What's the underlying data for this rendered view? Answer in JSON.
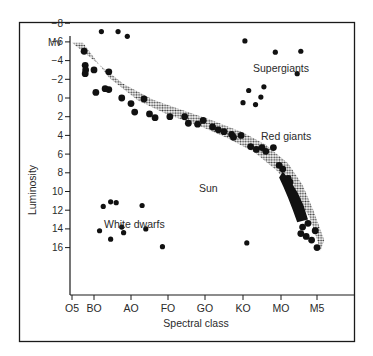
{
  "chart_data": {
    "type": "scatter",
    "title": "",
    "xlabel": "Spectral class",
    "ylabel": "Luminosity",
    "y_unit_label": "Mv",
    "x_categories": [
      "O5",
      "BO",
      "AO",
      "FO",
      "GO",
      "KO",
      "MO",
      "M5"
    ],
    "y_ticks": [
      -8,
      -6,
      -4,
      -2,
      0,
      2,
      4,
      6,
      8,
      10,
      12,
      14,
      16
    ],
    "y_tick_labels": [
      "−8",
      "−6",
      "−4",
      "−2",
      "0",
      "2",
      "4",
      "6",
      "8",
      "10",
      "12",
      "14",
      "16"
    ],
    "ylim": [
      17,
      -9
    ],
    "grid": false,
    "legend": "none",
    "annotations": [
      {
        "text": "Supergiants",
        "x": 6.3,
        "y": -7.2
      },
      {
        "text": "Red giants",
        "x": 6.6,
        "y": -0.2
      },
      {
        "text": "Sun",
        "x": 4.6,
        "y": 6.2
      },
      {
        "text": "White dwarfs",
        "x": 1.6,
        "y": 9.4
      }
    ],
    "main_sequence_band": {
      "upper": [
        [
          0.0,
          -5.9
        ],
        [
          1.0,
          -4.0
        ],
        [
          1.8,
          -1.5
        ],
        [
          2.6,
          0.2
        ],
        [
          3.4,
          1.3
        ],
        [
          4.2,
          2.4
        ],
        [
          5.0,
          3.7
        ],
        [
          5.6,
          5.0
        ],
        [
          6.2,
          7.0
        ],
        [
          6.6,
          9.3
        ],
        [
          6.9,
          12.0
        ],
        [
          7.2,
          15.2
        ]
      ],
      "lower": [
        [
          0.5,
          -5.9
        ],
        [
          1.4,
          -2.2
        ],
        [
          2.2,
          0.3
        ],
        [
          3.0,
          1.8
        ],
        [
          3.8,
          2.9
        ],
        [
          4.6,
          4.3
        ],
        [
          5.3,
          5.8
        ],
        [
          5.9,
          7.8
        ],
        [
          6.4,
          10.2
        ],
        [
          6.8,
          12.8
        ],
        [
          7.1,
          16.3
        ]
      ]
    },
    "series": [
      {
        "name": "Supergiants",
        "points": [
          [
            1.2,
            -7.1
          ],
          [
            1.65,
            -7.1
          ],
          [
            1.9,
            -6.6
          ],
          [
            5.05,
            -6.1
          ],
          [
            5.85,
            -4.9
          ],
          [
            6.55,
            -5.0
          ],
          [
            6.45,
            -2.6
          ]
        ]
      },
      {
        "name": "Red giants",
        "points": [
          [
            5.15,
            -0.8
          ],
          [
            5.55,
            -1.2
          ],
          [
            5.47,
            -0.1
          ],
          [
            5.0,
            0.5
          ],
          [
            5.33,
            0.7
          ]
        ]
      },
      {
        "name": "White dwarfs",
        "points": [
          [
            1.25,
            11.6
          ],
          [
            1.45,
            11.1
          ],
          [
            1.6,
            11.2
          ],
          [
            2.3,
            11.5
          ],
          [
            1.15,
            14.2
          ],
          [
            1.75,
            13.8
          ],
          [
            1.8,
            14.4
          ],
          [
            2.4,
            14.0
          ],
          [
            1.45,
            15.1
          ],
          [
            2.85,
            15.9
          ],
          [
            5.1,
            15.5
          ]
        ]
      },
      {
        "name": "Main sequence",
        "points": [
          [
            0.55,
            -5.0
          ],
          [
            0.6,
            -3.5
          ],
          [
            0.62,
            -3.0
          ],
          [
            0.6,
            -2.6
          ],
          [
            1.0,
            -3.0
          ],
          [
            1.4,
            -2.8
          ],
          [
            1.05,
            -0.6
          ],
          [
            1.4,
            -0.9
          ],
          [
            1.3,
            -1.0
          ],
          [
            1.75,
            0.0
          ],
          [
            2.0,
            0.6
          ],
          [
            2.1,
            1.5
          ],
          [
            2.35,
            0.1
          ],
          [
            2.5,
            1.7
          ],
          [
            2.65,
            2.1
          ],
          [
            3.05,
            2.0
          ],
          [
            3.45,
            2.0
          ],
          [
            3.55,
            2.7
          ],
          [
            3.8,
            2.8
          ],
          [
            3.95,
            2.4
          ],
          [
            4.2,
            3.1
          ],
          [
            4.35,
            3.4
          ],
          [
            4.5,
            3.6
          ],
          [
            4.7,
            3.9
          ],
          [
            4.75,
            4.2
          ],
          [
            4.95,
            4.0
          ],
          [
            5.2,
            5.2
          ],
          [
            5.35,
            5.5
          ],
          [
            5.5,
            5.3
          ],
          [
            5.6,
            5.7
          ],
          [
            5.8,
            5.3
          ],
          [
            5.95,
            7.2
          ],
          [
            6.05,
            7.6
          ],
          [
            6.2,
            8.6
          ],
          [
            6.25,
            9.0
          ],
          [
            6.3,
            10.0
          ],
          [
            6.4,
            10.6
          ],
          [
            6.45,
            11.4
          ],
          [
            6.5,
            12.0
          ],
          [
            6.55,
            12.6
          ],
          [
            6.75,
            13.4
          ],
          [
            6.6,
            13.8
          ],
          [
            6.55,
            14.5
          ],
          [
            6.7,
            14.8
          ],
          [
            6.85,
            15.2
          ],
          [
            6.95,
            14.2
          ],
          [
            7.0,
            16.0
          ]
        ]
      }
    ]
  }
}
